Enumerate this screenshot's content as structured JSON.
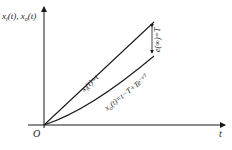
{
  "diagram": {
    "y_axis_label": {
      "main1": "x",
      "sub1": "i",
      "mid": "(t), ",
      "main2": "x",
      "sub2": "o",
      "end": "(t)"
    },
    "x_axis_label": "t",
    "origin_label": "O",
    "input_curve_label": {
      "prefix": "x",
      "sub": "i",
      "rest": "(t)=t"
    },
    "output_curve_label": {
      "prefix": "x",
      "sub": "o",
      "rest": "(t)=t−T+Te",
      "sup": "−t/T"
    },
    "error_label": "e(∞)=T",
    "colors": {
      "line": "#1a1a1a",
      "background": "#ffffff"
    }
  }
}
